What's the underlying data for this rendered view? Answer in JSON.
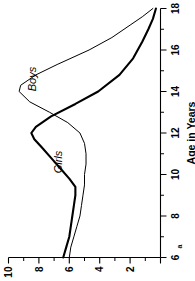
{
  "figure": {
    "panel_letter": "a",
    "rotation_degrees": -90
  },
  "chart_data": {
    "type": "line",
    "title": "",
    "subtitle": "",
    "xlabel": "Age in Years",
    "ylabel": "Height Gain, cm/year",
    "xlim": [
      6,
      18
    ],
    "ylim": [
      0,
      10
    ],
    "xticks": [
      6,
      8,
      10,
      12,
      14,
      16,
      18
    ],
    "xtick_labels": [
      "6",
      "8",
      "10",
      "12",
      "14",
      "16",
      "18"
    ],
    "yticks": [
      0,
      2,
      4,
      6,
      8,
      10
    ],
    "ytick_labels": [
      "0",
      "2",
      "4",
      "6",
      "8",
      "10"
    ],
    "y_minor_ticks": [
      1,
      3,
      5,
      7,
      9
    ],
    "x_minor_ticks": [
      7,
      9,
      11,
      13,
      15,
      17
    ],
    "grid": false,
    "legend_position": "inline-annotations",
    "annotations": [
      {
        "text": "Boys",
        "x": 14.6,
        "y": 8.2,
        "style": "italic"
      },
      {
        "text": "Girls",
        "x": 10.6,
        "y": 6.5,
        "style": "italic"
      }
    ],
    "series": [
      {
        "name": "Boys",
        "label": "Boys",
        "color": "#000000",
        "line_width": 1.0,
        "x": [
          6.0,
          6.5,
          7.0,
          7.5,
          8.0,
          8.5,
          9.0,
          9.5,
          10.0,
          10.5,
          11.0,
          11.5,
          12.0,
          12.5,
          13.0,
          13.5,
          14.0,
          14.3,
          14.8,
          15.3,
          16.0,
          16.6,
          17.2,
          17.6,
          18.0
        ],
        "y": [
          6.0,
          5.9,
          5.7,
          5.5,
          5.3,
          5.2,
          5.1,
          5.0,
          5.0,
          4.9,
          4.9,
          5.0,
          5.3,
          6.1,
          7.3,
          8.6,
          9.3,
          9.2,
          8.2,
          6.8,
          4.7,
          3.2,
          2.0,
          1.2,
          0.5
        ]
      },
      {
        "name": "Girls",
        "label": "Girls",
        "color": "#000000",
        "line_width": 2.1,
        "x": [
          6.0,
          6.5,
          7.0,
          7.5,
          8.0,
          8.5,
          9.0,
          9.4,
          9.8,
          10.3,
          10.8,
          11.3,
          11.7,
          12.0,
          12.3,
          12.8,
          13.4,
          14.0,
          14.8,
          15.6,
          16.4,
          17.0,
          17.5,
          18.0
        ],
        "y": [
          6.4,
          6.2,
          6.0,
          5.9,
          5.8,
          5.7,
          5.6,
          5.6,
          6.0,
          6.6,
          7.2,
          7.8,
          8.3,
          8.5,
          8.2,
          7.2,
          5.6,
          4.1,
          2.7,
          1.8,
          1.2,
          0.8,
          0.5,
          0.3
        ]
      }
    ]
  }
}
